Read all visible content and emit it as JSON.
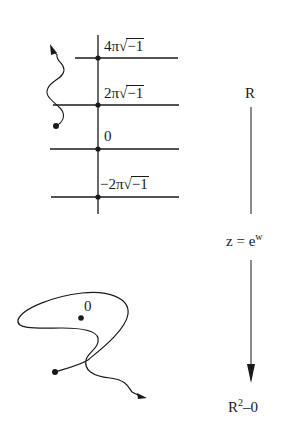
{
  "top_diagram": {
    "description": "Universal cover: horizontal lines at multiples of 2*pi*sqrt(-1)",
    "levels": [
      {
        "coefficient": "4π",
        "radicand": "−1",
        "label": "4π√−1"
      },
      {
        "coefficient": "2π",
        "radicand": "−1",
        "label": "2π√−1"
      },
      {
        "coefficient": "",
        "radicand": "",
        "label": "0"
      },
      {
        "coefficient": "−2π",
        "radicand": "−1",
        "label": "−2π√−1"
      }
    ]
  },
  "bottom_diagram": {
    "origin_label": "0",
    "description": "Loop around the origin in punctured plane with path"
  },
  "map": {
    "top_space": "R",
    "formula_left": "z",
    "formula_eq": "=",
    "formula_base": "e",
    "formula_exp": "w",
    "bottom_space_base": "R",
    "bottom_space_exp": "2",
    "bottom_space_rest": "–0"
  },
  "colors": {
    "ink": "#1a1a1a",
    "background": "#ffffff"
  }
}
